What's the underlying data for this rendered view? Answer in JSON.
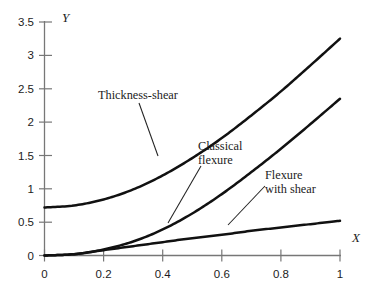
{
  "chart_data": {
    "type": "line",
    "title": "",
    "xlabel": "X",
    "ylabel": "Y",
    "xlim": [
      0,
      1
    ],
    "ylim": [
      0,
      3.5
    ],
    "grid": false,
    "legend_position": "inline-annotations",
    "x_ticks": [
      "0",
      "0.2",
      "0.4",
      "0.6",
      "0.8",
      "1"
    ],
    "x_tick_values": [
      0,
      0.2,
      0.4,
      0.6,
      0.8,
      1
    ],
    "y_ticks": [
      "0",
      "0.5",
      "1",
      "1.5",
      "2",
      "2.5",
      "3",
      "3.5"
    ],
    "y_tick_values": [
      0,
      0.5,
      1,
      1.5,
      2,
      2.5,
      3,
      3.5
    ],
    "x": [
      0,
      0.1,
      0.2,
      0.3,
      0.4,
      0.5,
      0.6,
      0.7,
      0.8,
      0.9,
      1
    ],
    "series": [
      {
        "name": "Thickness-shear",
        "values": [
          0.72,
          0.75,
          0.84,
          0.99,
          1.2,
          1.46,
          1.76,
          2.1,
          2.46,
          2.85,
          3.25
        ]
      },
      {
        "name": "Classical flexure",
        "values": [
          0.0,
          0.02,
          0.09,
          0.21,
          0.39,
          0.63,
          0.92,
          1.25,
          1.6,
          1.97,
          2.35
        ]
      },
      {
        "name": "Flexure with shear",
        "values": [
          0.0,
          0.02,
          0.08,
          0.14,
          0.2,
          0.26,
          0.31,
          0.37,
          0.42,
          0.47,
          0.52
        ]
      }
    ],
    "annotations": [
      {
        "id": "thickness-shear",
        "lines": [
          "Thickness-shear"
        ],
        "text": "Thickness-shear"
      },
      {
        "id": "classical-flexure",
        "lines": [
          "Classical",
          "flexure"
        ],
        "text": "Classical flexure"
      },
      {
        "id": "flexure-with-shear",
        "lines": [
          "Flexure",
          "with shear"
        ],
        "text": "Flexure with shear"
      }
    ],
    "colors": {
      "curve": "#111111",
      "axis": "#777777",
      "text": "#1c1c1c",
      "background": "#ffffff"
    }
  }
}
